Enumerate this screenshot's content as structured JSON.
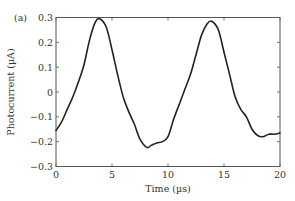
{
  "panel_label": "(a)",
  "chart_data": {
    "type": "line",
    "title": "",
    "xlabel": "Time (µs)",
    "ylabel": "Photocurrent (µA)",
    "xlim": [
      0,
      20
    ],
    "ylim": [
      -0.3,
      0.3
    ],
    "xticks": [
      0,
      5,
      10,
      15,
      20
    ],
    "xtick_labels": [
      "0",
      "5",
      "10",
      "15",
      "20"
    ],
    "yticks": [
      0.3,
      0.2,
      0.1,
      0,
      -0.1,
      -0.2,
      -0.3
    ],
    "ytick_labels": [
      "0.3",
      "0.2",
      "0.1",
      "0",
      "−0.1",
      "−0.2",
      "−0.3"
    ],
    "grid": false,
    "legend": null,
    "series": [
      {
        "name": "Photocurrent",
        "color": "#222222",
        "x": [
          0,
          0.5,
          1,
          1.5,
          2,
          2.5,
          3,
          3.5,
          3.9,
          4.5,
          5,
          5.5,
          6,
          6.5,
          7,
          7.5,
          8.1,
          8.5,
          9,
          9.5,
          10,
          10.5,
          11,
          11.5,
          12,
          12.5,
          13,
          13.5,
          13.9,
          14.5,
          15,
          15.5,
          16,
          16.5,
          17,
          17.5,
          18,
          18.5,
          19,
          19.5,
          20
        ],
        "y": [
          -0.155,
          -0.12,
          -0.07,
          -0.02,
          0.04,
          0.11,
          0.21,
          0.28,
          0.295,
          0.26,
          0.17,
          0.07,
          -0.02,
          -0.08,
          -0.13,
          -0.19,
          -0.223,
          -0.215,
          -0.205,
          -0.2,
          -0.18,
          -0.11,
          -0.05,
          0.01,
          0.07,
          0.15,
          0.23,
          0.275,
          0.285,
          0.25,
          0.16,
          0.07,
          -0.02,
          -0.07,
          -0.1,
          -0.15,
          -0.175,
          -0.18,
          -0.17,
          -0.17,
          -0.165
        ]
      }
    ]
  }
}
